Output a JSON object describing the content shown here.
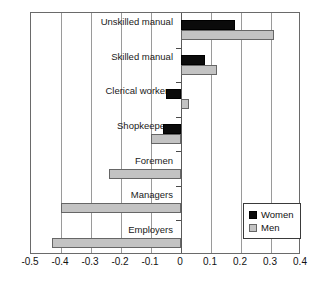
{
  "chart_data": {
    "type": "bar",
    "orientation": "horizontal",
    "title": "",
    "xlabel": "",
    "ylabel": "",
    "xlim": [
      -0.5,
      0.4
    ],
    "xticks": [
      -0.5,
      -0.4,
      -0.3,
      -0.2,
      -0.1,
      0,
      0.1,
      0.2,
      0.3,
      0.4
    ],
    "xticklabels": [
      "-0.5",
      "-0.4",
      "-0.3",
      "-0.2",
      "-0.1",
      "0",
      "0.1",
      "0.2",
      "0.3",
      "0.4"
    ],
    "grid": true,
    "grid_axis": "x",
    "legend_position": "lower right",
    "categories": [
      "Unskilled manual",
      "Skilled manual",
      "Clerical workers",
      "Shopkeepers",
      "Foremen",
      "Managers",
      "Employers"
    ],
    "series": [
      {
        "name": "Women",
        "color": "#0b0b0b",
        "values": [
          0.18,
          0.08,
          -0.05,
          -0.06,
          0,
          0,
          0
        ]
      },
      {
        "name": "Men",
        "color": "#c3c3c3",
        "values": [
          0.31,
          0.12,
          0.025,
          -0.1,
          -0.24,
          -0.4,
          -0.43
        ]
      }
    ]
  },
  "legend": {
    "items": [
      {
        "label": "Women",
        "swatch": "women"
      },
      {
        "label": "Men",
        "swatch": "men"
      }
    ]
  }
}
